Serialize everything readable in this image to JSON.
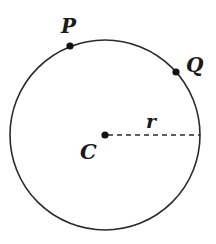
{
  "diagram": {
    "colors": {
      "stroke": "#2a2a2a",
      "text": "#1a1a1a",
      "background": "#ffffff"
    },
    "circle": {
      "cx": 105,
      "cy": 135,
      "r": 95
    },
    "points": [
      {
        "name": "P",
        "label": "P",
        "x": 70,
        "y": 46,
        "label_x": 62,
        "label_y": 33
      },
      {
        "name": "Q",
        "label": "Q",
        "x": 176,
        "y": 72,
        "label_x": 187,
        "label_y": 72
      },
      {
        "name": "C",
        "label": "C",
        "x": 105,
        "y": 135,
        "label_x": 80,
        "label_y": 159
      }
    ],
    "radius_line": {
      "label": "r",
      "style": "dashed",
      "label_x": 146,
      "label_y": 127
    }
  }
}
